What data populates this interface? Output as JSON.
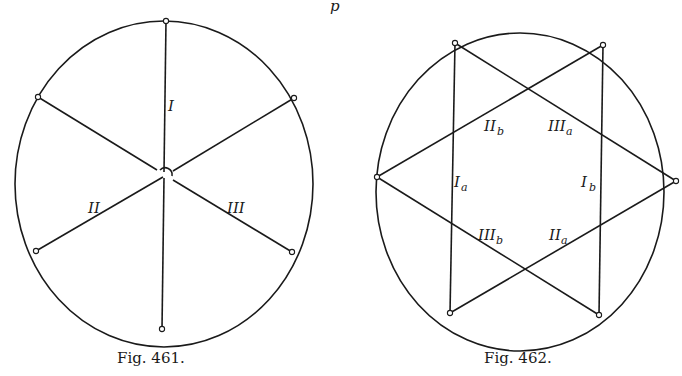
{
  "page": {
    "header_fragment": "p"
  },
  "figures": [
    {
      "id": "fig461",
      "caption": "Fig. 461.",
      "labels": {
        "I": "I",
        "II": "II",
        "III": "III"
      }
    },
    {
      "id": "fig462",
      "caption": "Fig. 462.",
      "labels": {
        "Ia": {
          "main": "I",
          "sub": "a"
        },
        "Ib": {
          "main": "I",
          "sub": "b"
        },
        "IIa": {
          "main": "II",
          "sub": "a"
        },
        "IIb": {
          "main": "II",
          "sub": "b"
        },
        "IIIa": {
          "main": "III",
          "sub": "a"
        },
        "IIIb": {
          "main": "III",
          "sub": "b"
        }
      }
    }
  ]
}
